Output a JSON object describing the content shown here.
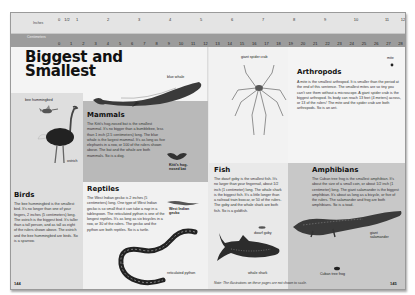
{
  "ruler": {
    "inches_label": "Inches",
    "centimeters_label": "Centimeters",
    "inch_ticks": [
      "0",
      "1/2",
      "1",
      "2",
      "3",
      "4",
      "5",
      "6",
      "7",
      "8",
      "9",
      "10",
      "11",
      "12"
    ],
    "cm_ticks": [
      "0",
      "1",
      "2",
      "3",
      "4",
      "5",
      "6",
      "7",
      "8",
      "9",
      "10",
      "11",
      "12",
      "13",
      "14",
      "15",
      "16",
      "17",
      "18",
      "19",
      "20",
      "21",
      "22",
      "23",
      "24",
      "25",
      "26",
      "27",
      "28",
      "29",
      "30"
    ]
  },
  "left_page": {
    "title_line1": "Biggest and",
    "title_line2": "Smallest",
    "page_number": "144",
    "captions": {
      "bee_hummingbird": "bee hummingbird",
      "ostrich": "ostrich",
      "blue_whale": "blue whale",
      "kittis_bat": "Kitti's hog-nosed bat",
      "west_indian_gecko": "West Indian gecko",
      "reticulated_python": "reticulated python"
    },
    "birds": {
      "heading": "Birds",
      "text": "The bee hummingbird is the smallest bird. It's no longer than one of your fingers, 2 inches (5 centimeters) long. The ostrich is the biggest bird. It's taller than a tall person, and as tall as eight of the rulers shown above. The ostrich and the bee hummingbird are birds. So is a sparrow."
    },
    "mammals": {
      "heading": "Mammals",
      "text": "The Kitti's hog-nosed bat is the smallest mammal. It's no bigger than a bumblebee, less than 1 inch (2.5 centimeters) long. The blue whale is the largest mammal. It's as long as five elephants in a row, or 100 of the rulers shown above. The bat and the whale are both mammals. So is a dog."
    },
    "reptiles": {
      "heading": "Reptiles",
      "text": "The West Indian gecko is 2 inches (5 centimeters) long. One type of West Indian gecko is so small that it can take a nap in a tablespoon. The reticulated python is one of the longest reptiles. It's as long as six bicycles in a row, or 30 of the rulers. The gecko and the python are both reptiles. So is a turtle."
    }
  },
  "right_page": {
    "page_number": "145",
    "note": "Note: The illustrations on these pages are not shown to scale.",
    "captions": {
      "giant_spider_crab": "giant spider crab",
      "mite": "mite",
      "dwarf_goby": "dwarf goby",
      "whale_shark": "whale shark",
      "giant_salamander": "giant salamander",
      "cuban_tree_frog": "Cuban tree frog"
    },
    "arthropods": {
      "heading": "Arthropods",
      "text": "A mite is the smallest arthropod. It is smaller than the period at the end of this sentence. The smallest mites are so tiny you can't see them without a microscope. A giant spider crab is the biggest arthropod. Its body can reach 13 feet (4 meters) across, or 13 of the rulers! The mite and the spider crab are both arthropods. So is an ant."
    },
    "fish": {
      "heading": "Fish",
      "text": "The dwarf goby is the smallest fish. It's no larger than your fingernail, about 1/2 inch (1 centimeter) long. The whale shark is the biggest fish. It's a little longer than a railroad train boxcar, or 50 of the rulers. The goby and the whale shark are both fish. So is a goldfish."
    },
    "amphibians": {
      "heading": "Amphibians",
      "text": "The Cuban tree frog is the smallest amphibian. It's about the size of a small coin, or about 1/2 inch (1 centimeter) long. The giant salamander is the biggest amphibian. It's about as long as a bicycle, or five of the rulers. The salamander and frog are both amphibians. So is a toad."
    }
  },
  "colors": {
    "ruler_inches_bg": "#e4e4e4",
    "ruler_cm_bg": "#9c9c9c",
    "mammals_panel": "#b9b9b9",
    "amphibians_panel": "#c8c8c8",
    "birds_panel": "#dedede"
  }
}
